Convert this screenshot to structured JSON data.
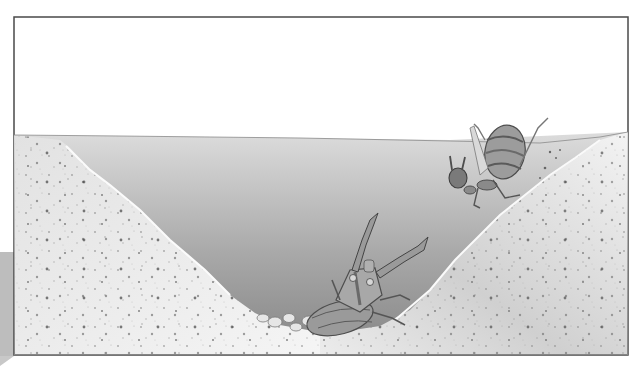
{
  "illustration": {
    "alt": "Cross-section illustration of an antlion pit in sand: an antlion larva waits at the bottom with raised jaws while an ant tumbles down the slope",
    "colors": {
      "background": "#ffffff",
      "frame": "#4a4a4a",
      "sand_light": "#f1f1f1",
      "sand_mid": "#d6d6d6",
      "pit_shadow_top": "#d8d8d8",
      "pit_shadow_bottom": "#8c8c8c",
      "insect_dark": "#555555",
      "insect_mid": "#8a8a8a",
      "insect_light": "#c4c4c4"
    },
    "subjects": [
      {
        "name": "antlion-larva",
        "position": "pit bottom center"
      },
      {
        "name": "ant",
        "position": "upper right slope, falling into pit"
      }
    ]
  }
}
